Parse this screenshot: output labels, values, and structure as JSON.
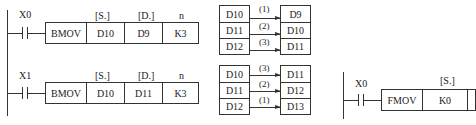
{
  "rung1": {
    "contact": "X0",
    "headers": [
      "[S.]",
      "[D.]",
      "n"
    ],
    "instruction": "BMOV",
    "operands": [
      "D10",
      "D9",
      "K3"
    ],
    "source_table": [
      "D10",
      "D11",
      "D12"
    ],
    "dest_table": [
      "D9",
      "D10",
      "D11"
    ],
    "arrow_labels": [
      "(1)",
      "(2)",
      "(3)"
    ]
  },
  "rung2": {
    "contact": "X1",
    "headers": [
      "[S.]",
      "[D.]",
      "n"
    ],
    "instruction": "BMOV",
    "operands": [
      "D10",
      "D11",
      "K3"
    ],
    "source_table": [
      "D10",
      "D11",
      "D12"
    ],
    "dest_table": [
      "D11",
      "D12",
      "D13"
    ],
    "arrow_labels": [
      "(3)",
      "(2)",
      "(1)"
    ]
  },
  "rung3": {
    "contact": "X0",
    "headers": [
      "[S.]"
    ],
    "instruction": "FMOV",
    "operands": [
      "K0"
    ]
  }
}
